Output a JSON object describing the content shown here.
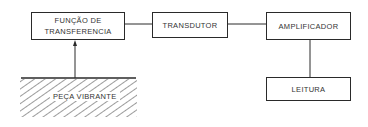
{
  "diagram": {
    "type": "block-diagram",
    "blocks": [
      {
        "id": "funcao",
        "label": "FUNÇÃO   DE\nTRANSFERENCIA"
      },
      {
        "id": "transdutor",
        "label": "TRANSDUTOR"
      },
      {
        "id": "amplificador",
        "label": "AMPLIFICADOR"
      },
      {
        "id": "leitura",
        "label": "LEITURA"
      }
    ],
    "ground": {
      "label": "PEÇA  VIBRANTE"
    },
    "connections": [
      {
        "from": "peca_vibrante",
        "to": "funcao",
        "arrow": true
      },
      {
        "from": "funcao",
        "to": "transdutor",
        "arrow": false
      },
      {
        "from": "transdutor",
        "to": "amplificador",
        "arrow": false
      },
      {
        "from": "amplificador",
        "to": "leitura",
        "arrow": false
      }
    ],
    "colors": {
      "line": "#2a2a2a",
      "text": "#333333",
      "background": "#ffffff"
    }
  }
}
